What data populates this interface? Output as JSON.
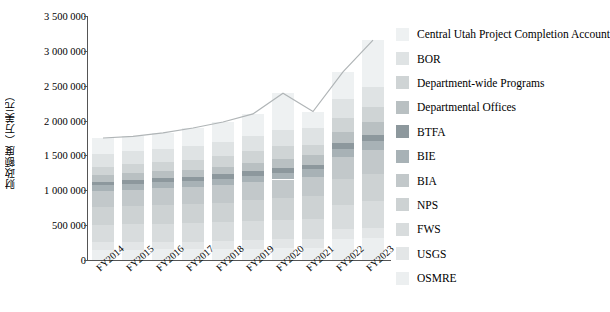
{
  "chart_data": {
    "type": "bar",
    "stacked": true,
    "title": "",
    "xlabel": "",
    "ylabel": "财政额度（万美元）",
    "categories": [
      "FY2014",
      "FY2015",
      "FY2016",
      "FY2017",
      "FY2018",
      "FY2019",
      "FY2020",
      "FY2021",
      "FY2022",
      "FY2023"
    ],
    "ylim": [
      0,
      3500000
    ],
    "yticks": [
      0,
      500000,
      1000000,
      1500000,
      2000000,
      2500000,
      3000000,
      3500000
    ],
    "ytick_labels": [
      "0",
      "500 000",
      "1 000 000",
      "1 500 000",
      "2 000 000",
      "2 500 000",
      "3 000 000",
      "3 500 000"
    ],
    "grid": false,
    "legend_position": "right",
    "series": [
      {
        "name": "OSMRE",
        "color": "#eceff0",
        "values": [
          150000,
          150000,
          155000,
          155000,
          160000,
          165000,
          170000,
          175000,
          300000,
          310000
        ]
      },
      {
        "name": "USGS",
        "color": "#e3e6e7",
        "values": [
          105000,
          110000,
          110000,
          110000,
          115000,
          120000,
          125000,
          130000,
          145000,
          155000
        ]
      },
      {
        "name": "FWS",
        "color": "#d8dcdd",
        "values": [
          245000,
          250000,
          255000,
          260000,
          265000,
          270000,
          280000,
          290000,
          350000,
          375000
        ]
      },
      {
        "name": "NPS",
        "color": "#cdd2d3",
        "values": [
          260000,
          265000,
          270000,
          275000,
          285000,
          300000,
          310000,
          320000,
          360000,
          390000
        ]
      },
      {
        "name": "BIA",
        "color": "#c2c8ca",
        "values": [
          230000,
          235000,
          240000,
          245000,
          250000,
          260000,
          270000,
          280000,
          320000,
          345000
        ]
      },
      {
        "name": "BIE",
        "color": "#a8b2b6",
        "values": [
          80000,
          82000,
          85000,
          88000,
          92000,
          96000,
          100000,
          105000,
          120000,
          130000
        ]
      },
      {
        "name": "BTFA",
        "color": "#8d989d",
        "values": [
          55000,
          57000,
          58000,
          60000,
          62000,
          65000,
          68000,
          70000,
          80000,
          88000
        ]
      },
      {
        "name": "Departmental Offices",
        "color": "#b9c0c2",
        "values": [
          95000,
          98000,
          100000,
          105000,
          110000,
          120000,
          130000,
          140000,
          165000,
          180000
        ]
      },
      {
        "name": "Department-wide Programs",
        "color": "#cfd4d5",
        "values": [
          120000,
          125000,
          130000,
          140000,
          150000,
          165000,
          180000,
          140000,
          195000,
          215000
        ]
      },
      {
        "name": "BOR",
        "color": "#dfe3e4",
        "values": [
          180000,
          185000,
          190000,
          195000,
          200000,
          215000,
          230000,
          240000,
          280000,
          300000
        ]
      },
      {
        "name": "Central Utah Project Completion Account",
        "color": "#eef1f2",
        "values": [
          230000,
          215000,
          230000,
          260000,
          290000,
          320000,
          530000,
          240000,
          385000,
          665000
        ]
      }
    ],
    "trend_line": {
      "present": true,
      "color": "#b0b5b7",
      "values": [
        1750000,
        1772000,
        1823000,
        1893000,
        1979000,
        2096000,
        2393000,
        2130000,
        2700000,
        3153000
      ]
    }
  },
  "legend": {
    "items": [
      {
        "label": "Central Utah Project Completion Account",
        "color": "#eef1f2"
      },
      {
        "label": "BOR",
        "color": "#dfe3e4"
      },
      {
        "label": "Department-wide Programs",
        "color": "#cfd4d5"
      },
      {
        "label": "Departmental Offices",
        "color": "#b9c0c2"
      },
      {
        "label": "BTFA",
        "color": "#8d989d"
      },
      {
        "label": "BIE",
        "color": "#a8b2b6"
      },
      {
        "label": "BIA",
        "color": "#c2c8ca"
      },
      {
        "label": "NPS",
        "color": "#cdd2d3"
      },
      {
        "label": "FWS",
        "color": "#d8dcdd"
      },
      {
        "label": "USGS",
        "color": "#e3e6e7"
      },
      {
        "label": "OSMRE",
        "color": "#eceff0"
      }
    ]
  }
}
